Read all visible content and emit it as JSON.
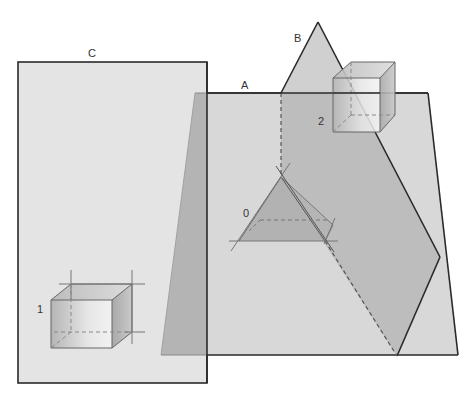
{
  "diagram": {
    "title": "",
    "labels": {
      "plane_a": "A",
      "plane_b": "B",
      "plane_c": "C",
      "object_0": "0",
      "object_1": "1",
      "object_2": "2"
    },
    "colors": {
      "background": "#ffffff",
      "plane_light": "#e3e3e3",
      "plane_a": "#d6d6d6",
      "plane_overlap": "#b9b9b9",
      "plane_b": "#c4c4c4",
      "edge": "#2a2a2a",
      "thin_edge": "#555555",
      "triangle_fill": "#a8a8a8"
    },
    "elements": [
      {
        "name": "plane C",
        "shape": "rectangle",
        "label": "C"
      },
      {
        "name": "plane A",
        "shape": "trapezoid",
        "label": "A"
      },
      {
        "name": "plane B",
        "shape": "triangle/polygon piercing A",
        "label": "B"
      },
      {
        "name": "object 0",
        "shape": "triangle prism in plane",
        "label": "0"
      },
      {
        "name": "object 1",
        "shape": "cube with projection lines",
        "label": "1"
      },
      {
        "name": "object 2",
        "shape": "cube",
        "label": "2"
      }
    ]
  }
}
